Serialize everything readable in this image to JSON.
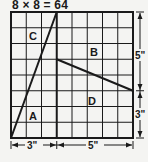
{
  "title": "8 × 8 = 64",
  "grid": {
    "rows": 8,
    "cols": 8
  },
  "regions": [
    {
      "label": "A"
    },
    {
      "label": "B"
    },
    {
      "label": "C"
    },
    {
      "label": "D"
    }
  ],
  "dimensions": {
    "bottom_left": "3\"",
    "bottom_right": "5\"",
    "right_top": "5\"",
    "right_bottom": "3\""
  },
  "colors": {
    "line": "#1a1a1a",
    "background": "#f4f4f2"
  }
}
